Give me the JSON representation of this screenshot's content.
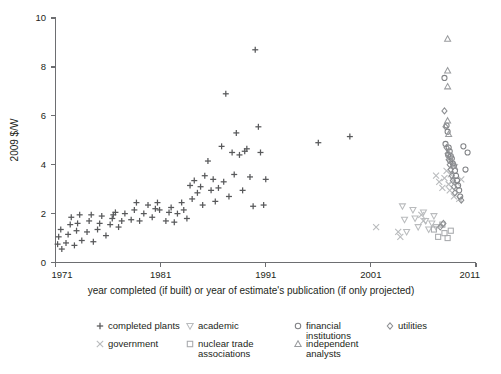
{
  "chart_data": {
    "type": "scatter",
    "title": "",
    "xlabel": "year completed (if built) or year of estimate's publication (if only projected)",
    "ylabel": "2009 $/W",
    "xlim": [
      1971,
      2011
    ],
    "ylim": [
      0,
      10
    ],
    "xticks": [
      1971,
      1981,
      1991,
      2001,
      2011
    ],
    "yticks": [
      0,
      2,
      4,
      6,
      8,
      10
    ],
    "grid": false,
    "legend_position": "bottom",
    "series": [
      {
        "name": "completed plants",
        "marker": "plus",
        "color": "#58595b",
        "points": [
          [
            1971.2,
            0.75
          ],
          [
            1971.3,
            1.05
          ],
          [
            1971.5,
            1.35
          ],
          [
            1971.6,
            0.55
          ],
          [
            1972.0,
            0.8
          ],
          [
            1972.2,
            1.15
          ],
          [
            1972.4,
            1.55
          ],
          [
            1972.5,
            1.85
          ],
          [
            1972.8,
            0.7
          ],
          [
            1973.0,
            1.3
          ],
          [
            1973.1,
            1.6
          ],
          [
            1973.3,
            1.95
          ],
          [
            1973.5,
            0.9
          ],
          [
            1974.0,
            1.25
          ],
          [
            1974.2,
            1.7
          ],
          [
            1974.4,
            1.95
          ],
          [
            1974.6,
            0.85
          ],
          [
            1975.0,
            1.35
          ],
          [
            1975.2,
            1.6
          ],
          [
            1975.4,
            1.9
          ],
          [
            1975.8,
            1.1
          ],
          [
            1976.2,
            1.55
          ],
          [
            1976.4,
            1.8
          ],
          [
            1976.5,
            1.95
          ],
          [
            1976.7,
            2.05
          ],
          [
            1977.0,
            1.45
          ],
          [
            1977.3,
            1.7
          ],
          [
            1977.6,
            2.0
          ],
          [
            1978.2,
            1.75
          ],
          [
            1978.5,
            2.15
          ],
          [
            1978.7,
            2.45
          ],
          [
            1979.0,
            1.7
          ],
          [
            1979.4,
            2.0
          ],
          [
            1979.8,
            2.35
          ],
          [
            1980.2,
            1.85
          ],
          [
            1980.5,
            2.2
          ],
          [
            1980.7,
            2.45
          ],
          [
            1980.9,
            2.15
          ],
          [
            1981.5,
            1.7
          ],
          [
            1981.8,
            2.05
          ],
          [
            1982.0,
            2.25
          ],
          [
            1982.3,
            1.65
          ],
          [
            1982.6,
            2.0
          ],
          [
            1983.0,
            2.45
          ],
          [
            1983.2,
            2.15
          ],
          [
            1983.5,
            1.8
          ],
          [
            1983.8,
            3.15
          ],
          [
            1984.0,
            2.6
          ],
          [
            1984.2,
            3.35
          ],
          [
            1984.5,
            2.85
          ],
          [
            1984.8,
            3.1
          ],
          [
            1985.0,
            2.35
          ],
          [
            1985.2,
            3.55
          ],
          [
            1985.5,
            4.15
          ],
          [
            1985.8,
            2.95
          ],
          [
            1986.0,
            3.4
          ],
          [
            1986.2,
            2.5
          ],
          [
            1986.5,
            3.05
          ],
          [
            1986.8,
            4.75
          ],
          [
            1987.0,
            3.3
          ],
          [
            1987.2,
            6.9
          ],
          [
            1987.5,
            2.7
          ],
          [
            1987.8,
            4.5
          ],
          [
            1988.0,
            3.6
          ],
          [
            1988.2,
            5.3
          ],
          [
            1988.5,
            4.4
          ],
          [
            1988.8,
            2.95
          ],
          [
            1989.0,
            4.55
          ],
          [
            1989.2,
            4.65
          ],
          [
            1989.5,
            3.5
          ],
          [
            1989.8,
            2.3
          ],
          [
            1990.0,
            8.7
          ],
          [
            1990.3,
            5.55
          ],
          [
            1990.5,
            4.5
          ],
          [
            1990.8,
            2.35
          ],
          [
            1991.0,
            3.4
          ],
          [
            1996.0,
            4.9
          ],
          [
            1999.0,
            5.15
          ]
        ]
      },
      {
        "name": "government",
        "marker": "cross",
        "color": "#b9bbbd",
        "points": [
          [
            2001.5,
            1.45
          ],
          [
            2003.6,
            1.25
          ],
          [
            2003.8,
            1.05
          ],
          [
            2005.8,
            1.95
          ],
          [
            2006.0,
            1.7
          ],
          [
            2007.2,
            3.55
          ],
          [
            2007.5,
            3.3
          ],
          [
            2007.8,
            3.05
          ],
          [
            2008.0,
            3.45
          ],
          [
            2008.2,
            3.75
          ],
          [
            2008.4,
            3.2
          ],
          [
            2008.5,
            2.95
          ],
          [
            2008.6,
            3.6
          ],
          [
            2008.8,
            3.35
          ],
          [
            2008.9,
            2.7
          ],
          [
            2009.0,
            3.9
          ],
          [
            2009.2,
            3.25
          ],
          [
            2009.4,
            2.6
          ],
          [
            2009.6,
            3.4
          ]
        ]
      },
      {
        "name": "academic",
        "marker": "triangle-down",
        "color": "#b9bbbd",
        "points": [
          [
            2004.0,
            2.3
          ],
          [
            2004.2,
            1.75
          ],
          [
            2004.4,
            1.25
          ],
          [
            2005.0,
            2.15
          ],
          [
            2005.2,
            1.8
          ],
          [
            2005.5,
            1.45
          ],
          [
            2006.0,
            2.05
          ],
          [
            2006.2,
            1.7
          ],
          [
            2006.5,
            1.35
          ],
          [
            2006.8,
            1.6
          ],
          [
            2007.0,
            1.9
          ],
          [
            2007.2,
            1.45
          ]
        ]
      },
      {
        "name": "nuclear trade associations",
        "marker": "square",
        "color": "#a7a9ac",
        "points": [
          [
            2007.0,
            1.35
          ],
          [
            2007.4,
            1.05
          ],
          [
            2007.8,
            1.55
          ],
          [
            2008.0,
            1.2
          ],
          [
            2008.3,
            1.0
          ],
          [
            2008.6,
            1.3
          ]
        ]
      },
      {
        "name": "financial institutions",
        "marker": "circle",
        "color": "#808285",
        "points": [
          [
            2008.0,
            7.55
          ],
          [
            2008.2,
            5.6
          ],
          [
            2008.3,
            5.35
          ],
          [
            2008.4,
            4.7
          ],
          [
            2008.5,
            4.55
          ],
          [
            2008.6,
            4.35
          ],
          [
            2008.7,
            4.25
          ],
          [
            2008.8,
            4.05
          ],
          [
            2008.9,
            3.95
          ],
          [
            2009.0,
            3.75
          ],
          [
            2009.1,
            3.55
          ],
          [
            2009.2,
            3.35
          ],
          [
            2009.3,
            3.15
          ],
          [
            2009.4,
            2.95
          ],
          [
            2009.5,
            2.7
          ],
          [
            2009.8,
            4.75
          ],
          [
            2010.0,
            3.8
          ],
          [
            2010.2,
            4.5
          ],
          [
            2008.1,
            4.85
          ],
          [
            2008.35,
            4.4
          ],
          [
            2008.55,
            4.15
          ]
        ]
      },
      {
        "name": "independent analysts",
        "marker": "triangle-up",
        "color": "#9a9c9f",
        "points": [
          [
            2008.3,
            9.15
          ],
          [
            2008.3,
            7.85
          ],
          [
            2008.3,
            7.2
          ],
          [
            2008.3,
            5.8
          ],
          [
            2008.4,
            5.25
          ],
          [
            2008.5,
            4.4
          ],
          [
            2008.7,
            4.15
          ],
          [
            2008.9,
            3.95
          ]
        ]
      },
      {
        "name": "utilities",
        "marker": "diamond",
        "color": "#8d8f92",
        "points": [
          [
            2008.0,
            6.2
          ],
          [
            2008.1,
            5.55
          ],
          [
            2008.2,
            4.7
          ],
          [
            2008.3,
            4.45
          ],
          [
            2008.4,
            4.2
          ],
          [
            2008.5,
            4.0
          ],
          [
            2008.6,
            3.8
          ],
          [
            2008.7,
            3.55
          ],
          [
            2008.8,
            3.35
          ],
          [
            2008.9,
            3.1
          ],
          [
            2009.0,
            2.85
          ],
          [
            2009.6,
            2.55
          ],
          [
            2007.6,
            1.45
          ],
          [
            2007.9,
            1.6
          ]
        ]
      }
    ]
  },
  "legend": {
    "entries": [
      {
        "label": "completed plants",
        "marker": "plus",
        "row": 0,
        "col": 0
      },
      {
        "label": "academic",
        "marker": "triangle-down",
        "row": 0,
        "col": 1
      },
      {
        "label": "financial institutions",
        "marker": "circle",
        "row": 0,
        "col": 2
      },
      {
        "label": "utilities",
        "marker": "diamond",
        "row": 0,
        "col": 3
      },
      {
        "label": "government",
        "marker": "cross",
        "row": 1,
        "col": 0
      },
      {
        "label": "nuclear trade associations",
        "marker": "square",
        "row": 1,
        "col": 1
      },
      {
        "label": "independent analysts",
        "marker": "triangle-up",
        "row": 1,
        "col": 2
      }
    ]
  },
  "colors": {
    "axis": "#6d6e71",
    "text": "#231f20",
    "plus": "#58595b",
    "cross": "#b9bbbd",
    "triangle_down": "#b9bbbd",
    "square": "#a7a9ac",
    "circle": "#808285",
    "triangle_up": "#9a9c9f",
    "diamond": "#8d8f92"
  }
}
